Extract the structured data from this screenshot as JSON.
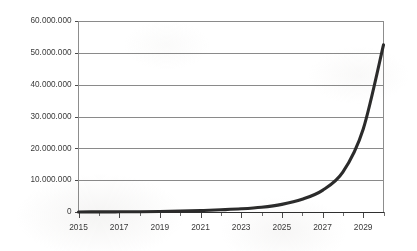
{
  "chart_data": {
    "type": "line",
    "title": "",
    "subtitle": "",
    "xlabel": "",
    "ylabel": "",
    "grid": true,
    "legend": false,
    "legend_position": "none",
    "number_format": "european-dot-thousands",
    "series_color": "#2b2b2b",
    "gridline_color": "#8a8a8a",
    "axis_color": "#8d8d8d",
    "background_color": "#ffffff",
    "xlim": [
      2015,
      2030
    ],
    "ylim": [
      0,
      60000000
    ],
    "y_ticks": [
      0,
      10000000,
      20000000,
      30000000,
      40000000,
      50000000,
      60000000
    ],
    "y_tick_labels": [
      "0",
      "10.000.000",
      "20.000.000",
      "30.000.000",
      "40.000.000",
      "50.000.000",
      "60.000.000"
    ],
    "x_ticks": [
      2015,
      2016,
      2017,
      2018,
      2019,
      2020,
      2021,
      2022,
      2023,
      2024,
      2025,
      2026,
      2027,
      2028,
      2029,
      2030
    ],
    "x_tick_labels": [
      "2015",
      "",
      "2017",
      "",
      "2019",
      "",
      "2021",
      "",
      "2023",
      "",
      "2025",
      "",
      "2027",
      "",
      "2029",
      ""
    ],
    "x_labeled_ticks": [
      2015,
      2017,
      2019,
      2021,
      2023,
      2025,
      2027,
      2029
    ],
    "series": [
      {
        "name": "",
        "x": [
          2015,
          2016,
          2017,
          2018,
          2019,
          2020,
          2021,
          2022,
          2023,
          2024,
          2025,
          2026,
          2027,
          2028,
          2029,
          2030
        ],
        "values": [
          20000,
          35000,
          60000,
          100000,
          170000,
          280000,
          450000,
          700000,
          1000000,
          1500000,
          2400000,
          4000000,
          6800000,
          12500000,
          26000000,
          52500000
        ]
      }
    ]
  }
}
